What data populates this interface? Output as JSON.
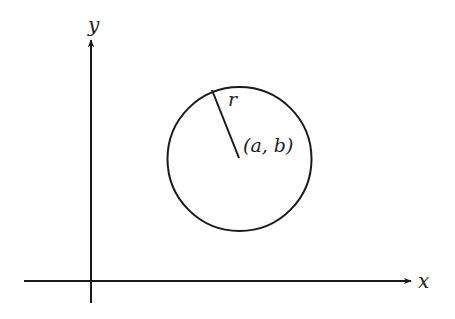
{
  "diagram": {
    "axes": {
      "x_label": "x",
      "y_label": "y"
    },
    "circle": {
      "center_label": "(a, b)",
      "radius_label": "r"
    },
    "colors": {
      "stroke": "#1a1a1a",
      "background": "#ffffff"
    }
  }
}
